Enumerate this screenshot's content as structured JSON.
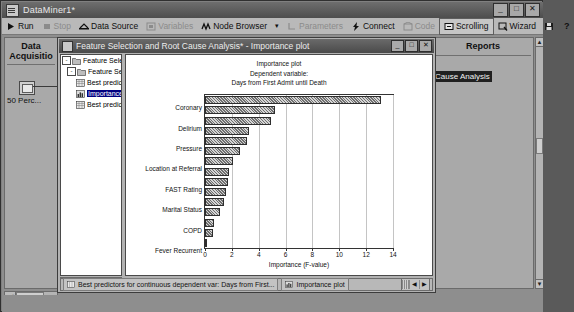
{
  "window": {
    "title": "DataMiner1*",
    "icon": "app-grid-icon",
    "controls": {
      "minimize": "_",
      "maximize": "□",
      "close": "✕"
    }
  },
  "toolbar": {
    "items": [
      {
        "label": "Run",
        "icon": "play-icon",
        "enabled": true,
        "boxed": false
      },
      {
        "label": "Stop",
        "icon": "stop-icon",
        "enabled": false,
        "boxed": false
      },
      {
        "label": "Data Source",
        "icon": "data-source-icon",
        "enabled": true,
        "boxed": false
      },
      {
        "label": "Variables",
        "icon": "variables-icon",
        "enabled": false,
        "boxed": false
      },
      {
        "label": "Node Browser",
        "icon": "node-browser-icon",
        "enabled": true,
        "boxed": false
      },
      {
        "label": "▾",
        "icon": "chevron-down-icon",
        "enabled": true,
        "boxed": false
      },
      {
        "label": "Parameters",
        "icon": "parameters-icon",
        "enabled": false,
        "boxed": false
      },
      {
        "label": "Connect",
        "icon": "connect-icon",
        "enabled": true,
        "boxed": false
      },
      {
        "label": "Code",
        "icon": "code-icon",
        "enabled": false,
        "boxed": false
      },
      {
        "label": "Scrolling",
        "icon": "scrolling-icon",
        "enabled": true,
        "boxed": true
      },
      {
        "label": "Wizard",
        "icon": "wizard-icon",
        "enabled": true,
        "boxed": false
      },
      {
        "label": "",
        "icon": "save-icon",
        "enabled": true,
        "boxed": false
      },
      {
        "label": "?",
        "icon": "help-icon",
        "enabled": true,
        "boxed": false
      }
    ]
  },
  "left_panel": {
    "title_line1": "Data",
    "title_line2": "Acquisitio",
    "node_caption": "50 Perc...",
    "scroll_left": "◀"
  },
  "right_panel": {
    "title": "Reports",
    "selected_item": "Cause Analysis",
    "scroll_up": "▲",
    "scroll_down": "▼"
  },
  "child_window": {
    "title": "Feature Selection and Root Cause Analysis* - Importance plot",
    "icon": "analysis-window-icon",
    "controls": {
      "minimize": "_",
      "maximize": "□",
      "close": "✕"
    },
    "tree": [
      {
        "label": "Feature Selection an",
        "indent": 0,
        "expander": "-",
        "icon": "folder-icon",
        "selected": false
      },
      {
        "label": "Feature Selection",
        "indent": 1,
        "expander": "-",
        "icon": "folder-icon",
        "selected": false
      },
      {
        "label": "Best predicto",
        "indent": 2,
        "expander": "",
        "icon": "spreadsheet-icon",
        "selected": false
      },
      {
        "label": "Importance p",
        "indent": 2,
        "expander": "",
        "icon": "chart-icon",
        "selected": true
      },
      {
        "label": "Best predicto",
        "indent": 2,
        "expander": "",
        "icon": "spreadsheet-icon",
        "selected": false
      }
    ],
    "tree_scroll": {
      "left": "◀",
      "right": "▶"
    },
    "status_tabs": [
      {
        "label": "Best predictors for continuous dependent var: Days from First...",
        "icon": "spreadsheet-icon"
      },
      {
        "label": "Importance plot",
        "icon": "chart-icon"
      }
    ],
    "status_nav": {
      "prev": "◀",
      "next": "▶"
    }
  },
  "chart_data": {
    "type": "bar",
    "orientation": "horizontal",
    "title": "Importance plot",
    "subtitle": "Dependent variable:",
    "subtitle2": "Days from First Admit until Death",
    "xlabel": "Importance (F-value)",
    "ylabel": "",
    "xlim": [
      0,
      14
    ],
    "xticks": [
      0,
      2,
      4,
      6,
      8,
      10,
      12,
      14
    ],
    "grid": true,
    "legend": false,
    "categories": [
      "Coronary",
      "",
      "Delirium",
      "",
      "Pressure",
      "",
      "Location at Referral",
      "",
      "FAST Rating",
      "",
      "Marital Status",
      "",
      "COPD",
      "",
      "Fever Recurrent"
    ],
    "tick_labels": [
      "Coronary",
      "Delirium",
      "Pressure",
      "Location at Referral",
      "FAST Rating",
      "Marital Status",
      "COPD",
      "Fever Recurrent"
    ],
    "values": [
      13.1,
      5.2,
      4.9,
      3.3,
      3.1,
      2.6,
      2.1,
      1.8,
      1.7,
      1.6,
      1.4,
      1.1,
      0.7,
      0.6,
      0.1
    ]
  }
}
